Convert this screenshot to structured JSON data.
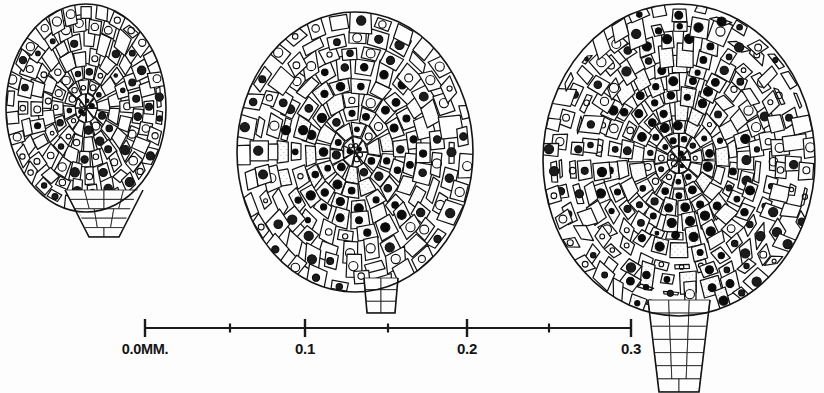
{
  "figure": {
    "kind": "scientific-illustration",
    "background_color": "#fdfdfd",
    "ink_color": "#1a1a1a",
    "width": 824,
    "height": 393
  },
  "scale_bar": {
    "name": "millimetre-scale-bar",
    "unit": "MM.",
    "axis": {
      "x_start": 145,
      "x_end": 631,
      "y": 328
    },
    "pixels_per_unit": 1620,
    "major_ticks": [
      {
        "label": "0.0MM.",
        "value": 0.0,
        "x": 145
      },
      {
        "label": "0.1",
        "value": 0.1,
        "x": 305
      },
      {
        "label": "0.2",
        "value": 0.2,
        "x": 467
      },
      {
        "label": "0.3",
        "value": 0.3,
        "x": 631
      }
    ],
    "minor_ticks": [
      {
        "value": 0.05,
        "x": 230
      },
      {
        "value": 0.15,
        "x": 388
      },
      {
        "value": 0.25,
        "x": 549
      }
    ]
  },
  "specimens": [
    {
      "id": "specimen-1",
      "name": "specimen-left-early-stage",
      "stage_order": 1,
      "bounds": {
        "x": 2,
        "y": 0,
        "width": 172,
        "height": 240
      },
      "body": {
        "cx": 86,
        "cy": 108,
        "rx": 80,
        "ry": 104
      },
      "stalk": {
        "present": true,
        "type": "tapering-base",
        "cx": 104,
        "top": 190,
        "bottom": 237,
        "top_width": 78,
        "bottom_width": 30
      },
      "approx_width_mm": 0.1,
      "cell_count": 150,
      "shading": "light"
    },
    {
      "id": "specimen-2",
      "name": "specimen-middle-intermediate-stage",
      "stage_order": 2,
      "bounds": {
        "x": 236,
        "y": 6,
        "width": 238,
        "height": 310
      },
      "body": {
        "cx": 355,
        "cy": 152,
        "rx": 118,
        "ry": 140
      },
      "stalk": {
        "present": true,
        "type": "short-peduncle",
        "cx": 381,
        "top": 278,
        "bottom": 313,
        "top_width": 34,
        "bottom_width": 28
      },
      "approx_width_mm": 0.147,
      "cell_count": 230,
      "shading": "medium-dark-core"
    },
    {
      "id": "specimen-3",
      "name": "specimen-right-late-stage",
      "stage_order": 3,
      "bounds": {
        "x": 543,
        "y": 4,
        "width": 272,
        "height": 389
      },
      "body": {
        "cx": 679,
        "cy": 160,
        "rx": 136,
        "ry": 156
      },
      "stalk": {
        "present": true,
        "type": "long-peduncle",
        "cx": 679,
        "top": 300,
        "bottom": 392,
        "top_width": 62,
        "bottom_width": 40
      },
      "approx_width_mm": 0.168,
      "cell_count": 300,
      "shading": "dark-central-column"
    }
  ],
  "rendering": {
    "cell_wall_color": "#141414",
    "nucleus_color": "#0d0d0d",
    "stipple_light": "#e9e9e9",
    "stipple_mid": "#b9b9b9",
    "stipple_dark": "#777777",
    "stipple_darkest": "#4a4a4a"
  }
}
